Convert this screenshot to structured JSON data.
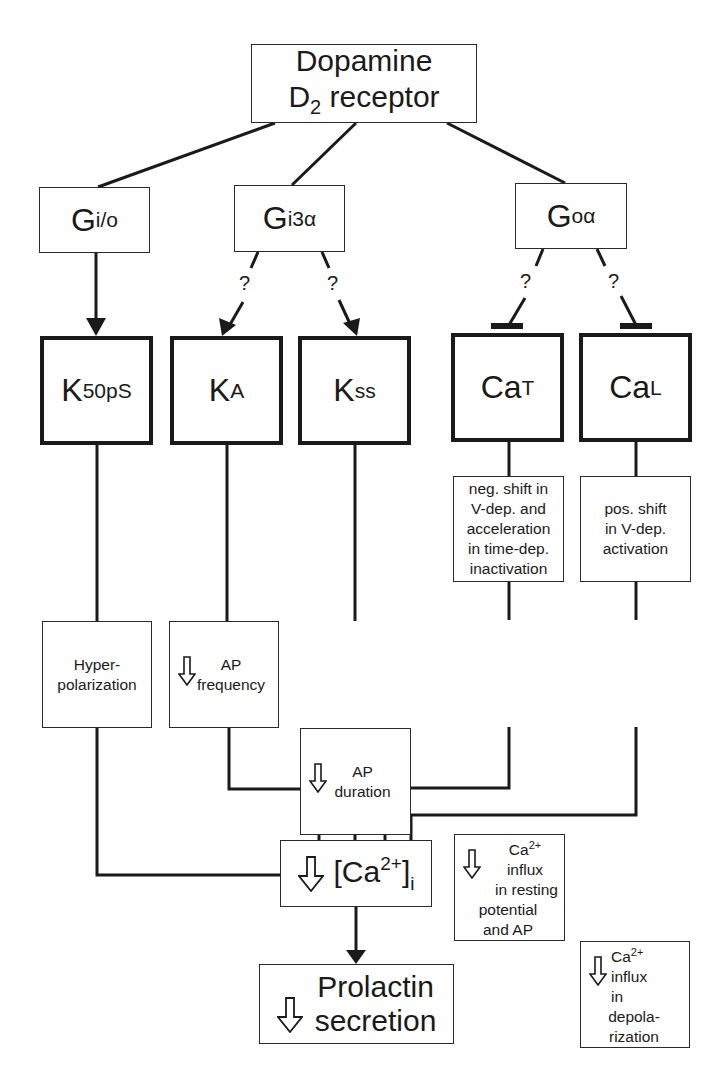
{
  "diagram": {
    "root": {
      "line1": "Dopamine",
      "line2_main": "D",
      "line2_sub": "2",
      "line2_rest": " receptor"
    },
    "g_proteins": [
      {
        "id": "gio",
        "main": "G",
        "sub": "i/o"
      },
      {
        "id": "gi3a",
        "main": "G",
        "sub": "i3α"
      },
      {
        "id": "goa",
        "main": "G",
        "sub": "oα"
      }
    ],
    "question_mark": "?",
    "channels": [
      {
        "id": "k50ps",
        "main": "K",
        "sub": "50pS",
        "from": "gio",
        "link": "activation",
        "certain": true
      },
      {
        "id": "ka",
        "main": "K",
        "sub": "A",
        "from": "gi3a",
        "link": "activation",
        "certain": false
      },
      {
        "id": "kss",
        "main": "K",
        "sub": "ss",
        "from": "gi3a",
        "link": "activation",
        "certain": false
      },
      {
        "id": "cat",
        "main": "Ca",
        "sub": "T",
        "from": "goa",
        "link": "inhibition",
        "certain": false
      },
      {
        "id": "cal",
        "main": "Ca",
        "sub": "L",
        "from": "goa",
        "link": "inhibition",
        "certain": false
      }
    ],
    "mechanisms": [
      {
        "id": "cat_mech",
        "lines": [
          "neg. shift in",
          "V-dep. and",
          "acceleration",
          "in time-dep.",
          "inactivation"
        ]
      },
      {
        "id": "cal_mech",
        "lines": [
          "pos. shift",
          "in V-dep.",
          "activation"
        ]
      }
    ],
    "effects": [
      {
        "id": "hyper",
        "down_arrow": false,
        "lines": [
          "Hyper-",
          "polarization"
        ]
      },
      {
        "id": "ap_freq",
        "down_arrow": true,
        "lines": [
          "AP",
          "frequency"
        ]
      },
      {
        "id": "ap_dur",
        "down_arrow": true,
        "lines": [
          "AP",
          "duration"
        ]
      },
      {
        "id": "ca_t_influx",
        "down_arrow": true,
        "ca_main": "Ca",
        "ca_sup": "2+",
        "lines": [
          "influx",
          "in resting",
          "potential",
          "and AP"
        ]
      },
      {
        "id": "ca_l_influx",
        "down_arrow": true,
        "ca_main": "Ca",
        "ca_sup": "2+",
        "lines": [
          "influx",
          "in",
          "depola-",
          "rization"
        ]
      }
    ],
    "intracellular": {
      "open": "[Ca",
      "sup": "2+",
      "close": "]",
      "sub": "i",
      "down_arrow": true
    },
    "output": {
      "line1": "Prolactin",
      "line2": "secretion",
      "down_arrow": true
    }
  },
  "colors": {
    "line": "#1a1a1a",
    "box_border": "#2a2a2a",
    "background": "#ffffff"
  }
}
